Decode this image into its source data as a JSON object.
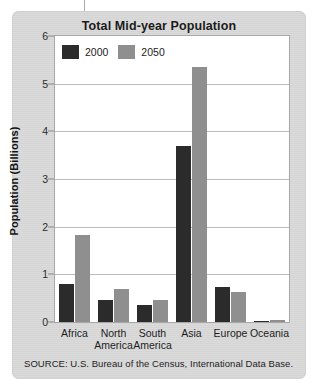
{
  "chart_data": {
    "type": "bar",
    "title": "Total Mid-year Population",
    "xlabel": "",
    "ylabel": "Population (Billions)",
    "ylim": [
      0,
      6
    ],
    "yticks": [
      0,
      1,
      2,
      3,
      4,
      5,
      6
    ],
    "ytick_labels": [
      "0",
      "1",
      "2",
      "3",
      "4",
      "5",
      "6"
    ],
    "grid": true,
    "legend_position": "top-left",
    "categories": [
      "Africa",
      "North America",
      "South America",
      "Asia",
      "Europe",
      "Oceania"
    ],
    "category_lines": [
      [
        "Africa"
      ],
      [
        "North",
        "America"
      ],
      [
        "South",
        "America"
      ],
      [
        "Asia"
      ],
      [
        "Europe"
      ],
      [
        "Oceania"
      ]
    ],
    "series": [
      {
        "name": "2000",
        "color": "#2b2b2b",
        "values": [
          0.8,
          0.47,
          0.35,
          3.7,
          0.73,
          0.03
        ]
      },
      {
        "name": "2050",
        "color": "#8f8f8f",
        "values": [
          1.82,
          0.69,
          0.47,
          5.36,
          0.63,
          0.05
        ]
      }
    ]
  },
  "source": {
    "text": "SOURCE: U.S. Bureau of the Census, International Data Base."
  },
  "colors": {
    "card_background": "#d7d7d7",
    "plot_background": "#ffffff",
    "gridline": "#bdbdbd",
    "series_2000": "#2b2b2b",
    "series_2050": "#8f8f8f",
    "text": "#1d1d1d"
  }
}
